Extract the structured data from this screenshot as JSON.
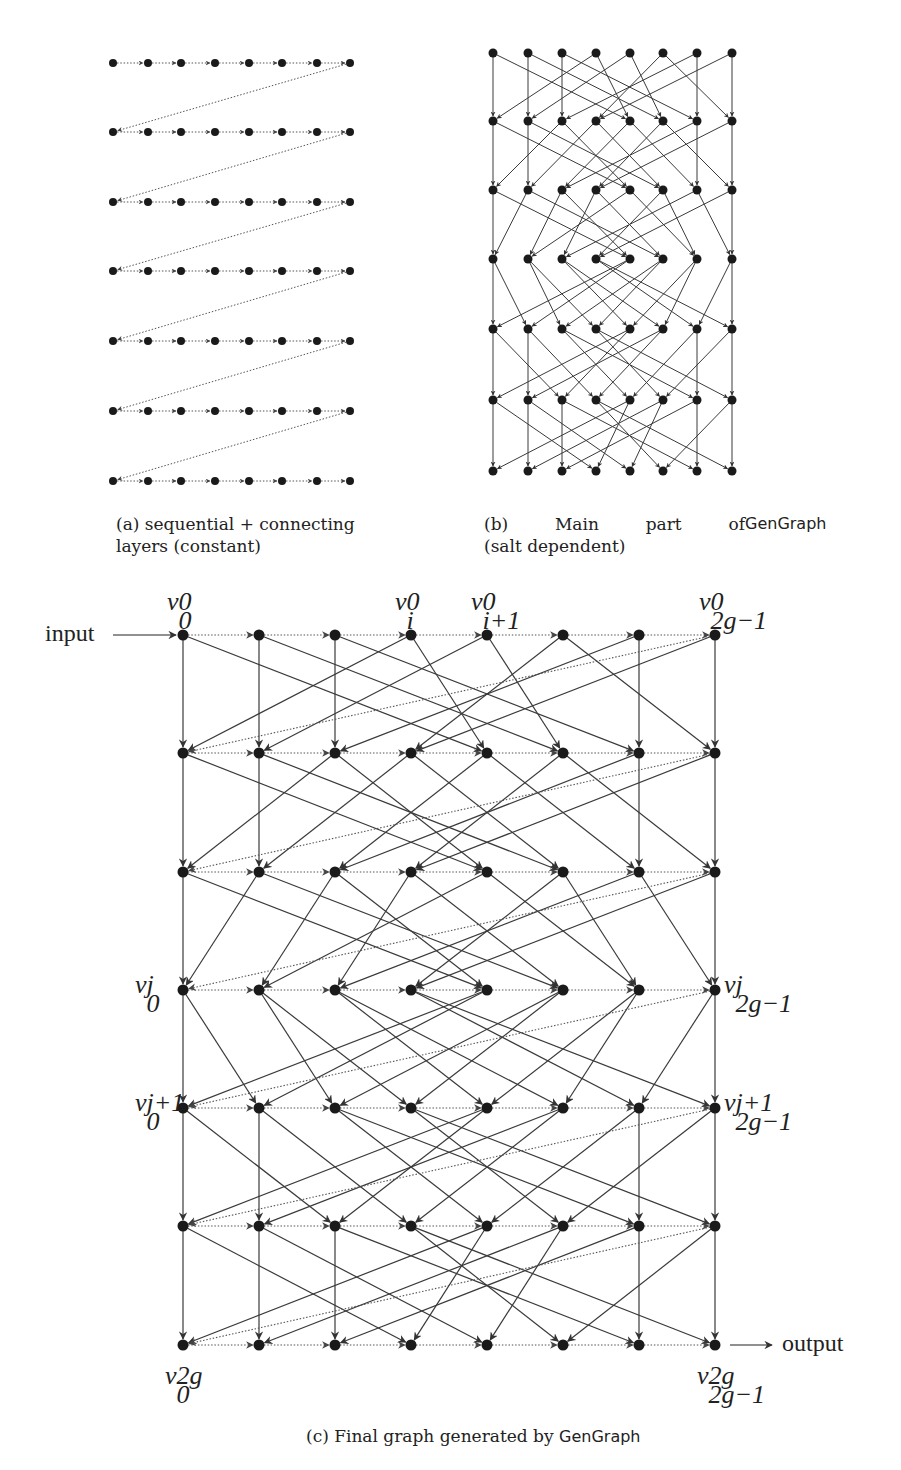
{
  "panel_a": {
    "caption_line1": "(a) sequential + connecting",
    "caption_line2": "layers (constant)",
    "xs": [
      113,
      148,
      181,
      215,
      249,
      282,
      317,
      350
    ],
    "ys": [
      63,
      132,
      202,
      271,
      341,
      411,
      481
    ]
  },
  "panel_b": {
    "caption_prefix": "(b)  Main  part  of",
    "caption_name": "GenGraph",
    "caption_line2": "(salt dependent)",
    "xs": [
      493,
      528,
      562,
      596,
      630,
      663,
      697,
      732
    ],
    "ys": [
      53,
      121,
      190,
      259,
      329,
      400,
      471
    ]
  },
  "panel_c": {
    "caption_prefix": "(c) Final graph generated by",
    "caption_name": "GenGraph",
    "input_label": "input",
    "output_label": "output",
    "xs": [
      183,
      259,
      335,
      411,
      487,
      563,
      639,
      715
    ],
    "ys": [
      635,
      753,
      872,
      990,
      1108,
      1226,
      1345
    ],
    "node_labels": {
      "top": [
        {
          "base": "v",
          "sup": "0",
          "sub": "0",
          "col": 0
        },
        {
          "base": "v",
          "sup": "0",
          "sub": "i",
          "col": 3
        },
        {
          "base": "v",
          "sup": "0",
          "sub": "i+1",
          "col": 4
        },
        {
          "base": "v",
          "sup": "0",
          "sub": "2g−1",
          "col": 7
        }
      ],
      "left": [
        {
          "base": "v",
          "sup": "j",
          "sub": "0",
          "row": 3
        },
        {
          "base": "v",
          "sup": "j+1",
          "sub": "0",
          "row": 4
        }
      ],
      "right": [
        {
          "base": "v",
          "sup": "j",
          "sub": "2g−1",
          "row": 3
        },
        {
          "base": "v",
          "sup": "j+1",
          "sub": "2g−1",
          "row": 4
        }
      ],
      "bottom": [
        {
          "base": "v",
          "sup": "2g",
          "sub": "0",
          "col": 0
        },
        {
          "base": "v",
          "sup": "2g",
          "sub": "2g−1",
          "col": 7
        }
      ]
    }
  },
  "graph_edges": {
    "description": "per layer transition: list of [from_col, to_col] solid edges",
    "layers": [
      [
        [
          0,
          0
        ],
        [
          0,
          4
        ],
        [
          1,
          1
        ],
        [
          1,
          5
        ],
        [
          2,
          2
        ],
        [
          2,
          6
        ],
        [
          3,
          0
        ],
        [
          3,
          4
        ],
        [
          4,
          1
        ],
        [
          4,
          5
        ],
        [
          5,
          3
        ],
        [
          5,
          7
        ],
        [
          6,
          6
        ],
        [
          6,
          2
        ],
        [
          7,
          7
        ],
        [
          7,
          3
        ]
      ],
      [
        [
          0,
          0
        ],
        [
          0,
          4
        ],
        [
          1,
          1
        ],
        [
          1,
          5
        ],
        [
          2,
          0
        ],
        [
          2,
          4
        ],
        [
          3,
          1
        ],
        [
          3,
          5
        ],
        [
          4,
          2
        ],
        [
          4,
          6
        ],
        [
          5,
          3
        ],
        [
          5,
          7
        ],
        [
          6,
          6
        ],
        [
          6,
          2
        ],
        [
          7,
          7
        ],
        [
          7,
          3
        ]
      ],
      [
        [
          0,
          0
        ],
        [
          0,
          4
        ],
        [
          1,
          0
        ],
        [
          1,
          5
        ],
        [
          2,
          1
        ],
        [
          2,
          4
        ],
        [
          3,
          2
        ],
        [
          3,
          5
        ],
        [
          4,
          1
        ],
        [
          4,
          6
        ],
        [
          5,
          3
        ],
        [
          5,
          6
        ],
        [
          6,
          2
        ],
        [
          6,
          7
        ],
        [
          7,
          7
        ],
        [
          7,
          3
        ]
      ],
      [
        [
          0,
          0
        ],
        [
          0,
          1
        ],
        [
          1,
          2
        ],
        [
          1,
          3
        ],
        [
          2,
          4
        ],
        [
          2,
          5
        ],
        [
          3,
          6
        ],
        [
          3,
          7
        ],
        [
          4,
          0
        ],
        [
          4,
          1
        ],
        [
          5,
          2
        ],
        [
          5,
          3
        ],
        [
          6,
          4
        ],
        [
          6,
          5
        ],
        [
          7,
          7
        ],
        [
          7,
          6
        ]
      ],
      [
        [
          0,
          0
        ],
        [
          0,
          2
        ],
        [
          1,
          1
        ],
        [
          1,
          3
        ],
        [
          2,
          4
        ],
        [
          2,
          6
        ],
        [
          3,
          5
        ],
        [
          3,
          7
        ],
        [
          4,
          0
        ],
        [
          4,
          2
        ],
        [
          5,
          1
        ],
        [
          5,
          3
        ],
        [
          6,
          6
        ],
        [
          6,
          4
        ],
        [
          7,
          7
        ],
        [
          7,
          5
        ]
      ],
      [
        [
          0,
          0
        ],
        [
          0,
          3
        ],
        [
          1,
          1
        ],
        [
          1,
          4
        ],
        [
          2,
          2
        ],
        [
          2,
          6
        ],
        [
          3,
          5
        ],
        [
          3,
          7
        ],
        [
          4,
          0
        ],
        [
          4,
          3
        ],
        [
          5,
          1
        ],
        [
          5,
          4
        ],
        [
          6,
          6
        ],
        [
          6,
          2
        ],
        [
          7,
          7
        ],
        [
          7,
          5
        ]
      ]
    ]
  },
  "colors": {
    "node": "#1a1a1a",
    "edge": "#3a3a3a",
    "dotted": "#555555"
  }
}
